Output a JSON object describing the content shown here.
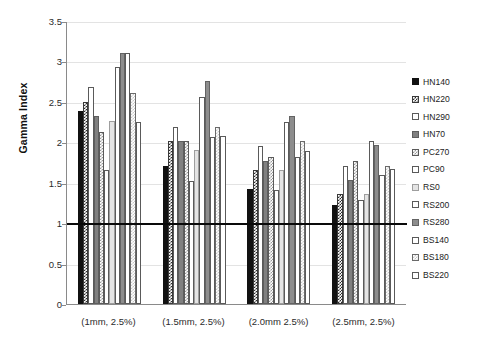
{
  "chart_data": {
    "type": "bar",
    "title": "",
    "xlabel": "",
    "ylabel": "Gamma Index",
    "ylim": [
      0,
      3.5
    ],
    "ytick_step": 0.5,
    "yticks": [
      "0",
      "0.5",
      "1",
      "1.5",
      "2",
      "2.5",
      "3",
      "3.5"
    ],
    "grid": true,
    "legend_position": "right",
    "reference_line": 1.0,
    "categories": [
      "(1mm, 2.5%)",
      "(1.5mm, 2.5%)",
      "(2.0mm 2.5%)",
      "(2.5mm, 2.5%)"
    ],
    "series": [
      {
        "name": "HN140",
        "pattern": "solid-black",
        "values": [
          2.39,
          1.71,
          1.43,
          1.23
        ]
      },
      {
        "name": "HN220",
        "pattern": "check-dark",
        "values": [
          2.51,
          2.02,
          1.66,
          1.36
        ]
      },
      {
        "name": "HN290",
        "pattern": "white",
        "values": [
          2.69,
          2.2,
          1.96,
          1.71
        ]
      },
      {
        "name": "HN70",
        "pattern": "solid-gray",
        "values": [
          2.33,
          2.02,
          1.78,
          1.54
        ]
      },
      {
        "name": "PC270",
        "pattern": "check-mid",
        "values": [
          2.14,
          2.02,
          1.83,
          1.78
        ]
      },
      {
        "name": "PC90",
        "pattern": "white",
        "values": [
          1.66,
          1.53,
          1.42,
          1.29
        ]
      },
      {
        "name": "RS0",
        "pattern": "verylight",
        "values": [
          2.27,
          1.91,
          1.66,
          1.36
        ]
      },
      {
        "name": "RS200",
        "pattern": "white",
        "values": [
          2.94,
          2.57,
          2.26,
          2.02
        ]
      },
      {
        "name": "RS280",
        "pattern": "solid-gray2",
        "values": [
          3.12,
          2.77,
          2.33,
          1.97
        ]
      },
      {
        "name": "BS140",
        "pattern": "white",
        "values": [
          3.12,
          2.07,
          1.83,
          1.6
        ]
      },
      {
        "name": "BS180",
        "pattern": "check-light",
        "values": [
          2.62,
          2.2,
          2.02,
          1.71
        ]
      },
      {
        "name": "BS220",
        "pattern": "white",
        "values": [
          2.26,
          2.08,
          1.9,
          1.68
        ]
      }
    ]
  },
  "axis": {
    "y_title": "Gamma Index"
  },
  "colors": {
    "background": "#ffffff",
    "axis": "#8a8a8a",
    "gridline": "#e3e3e3",
    "reference_line": "#0a0a0a",
    "text": "#2b2b2b"
  }
}
